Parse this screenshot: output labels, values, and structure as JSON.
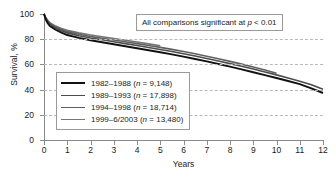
{
  "chart_data": {
    "type": "line",
    "title": "",
    "xlabel": "Years",
    "ylabel": "Survival, %",
    "xlim": [
      0,
      12
    ],
    "ylim": [
      0,
      100
    ],
    "xticks": [
      "0",
      "1",
      "2",
      "3",
      "4",
      "5",
      "6",
      "7",
      "8",
      "9",
      "10",
      "11",
      "12"
    ],
    "yticks": [
      "0",
      "20",
      "40",
      "60",
      "80",
      "100"
    ],
    "gridlines": {
      "y": [
        20,
        40,
        60,
        80
      ],
      "style": "dashed",
      "x": false
    },
    "legend_position": "inside-lower-left",
    "annotation": "All comparisons significant at p < 0.01",
    "annotation_prefix": "All comparisons significant at ",
    "annotation_italic": "p",
    "annotation_suffix": " < 0.01",
    "series": [
      {
        "name": "1982–1988",
        "n": "9,148",
        "label_prefix": "1982–1988 (",
        "label_italic": "n",
        "label_suffix": " = 9,148)",
        "color": "#111111",
        "x": [
          0,
          0.08,
          0.17,
          0.25,
          0.5,
          0.75,
          1,
          1.5,
          2,
          2.5,
          3,
          3.5,
          4,
          4.5,
          5,
          5.5,
          6,
          6.5,
          7,
          7.5,
          8,
          8.5,
          9,
          9.5,
          10,
          10.5,
          11,
          11.5,
          12
        ],
        "y": [
          100,
          95.5,
          92.5,
          90.5,
          87.5,
          85.2,
          83.3,
          81.0,
          79.2,
          77.6,
          76.0,
          74.4,
          72.8,
          71.2,
          69.6,
          68.0,
          66.2,
          64.3,
          62.4,
          60.3,
          58.2,
          56.0,
          53.8,
          51.5,
          49.2,
          46.8,
          44.3,
          41.0,
          37.3
        ]
      },
      {
        "name": "1989–1993",
        "n": "17,898",
        "label_prefix": "1989–1993 (",
        "label_italic": "n",
        "label_suffix": " = 17,898)",
        "color": "#4d4d4d",
        "x": [
          0,
          0.08,
          0.17,
          0.25,
          0.5,
          0.75,
          1,
          1.5,
          2,
          2.5,
          3,
          3.5,
          4,
          4.5,
          5,
          5.5,
          6,
          6.5,
          7,
          7.5,
          8,
          8.5,
          9,
          9.5,
          10,
          10.5,
          11,
          11.5,
          12
        ],
        "y": [
          100,
          96.2,
          93.6,
          91.8,
          88.8,
          86.7,
          85.0,
          82.8,
          81.0,
          79.5,
          78.0,
          76.5,
          75.0,
          73.4,
          71.8,
          70.2,
          68.4,
          66.6,
          64.7,
          62.7,
          60.6,
          58.5,
          56.3,
          54.0,
          51.7,
          49.2,
          46.7,
          43.8,
          40.2
        ]
      },
      {
        "name": "1994–1998",
        "n": "18,714",
        "label_prefix": "1994–1998 (",
        "label_italic": "n",
        "label_suffix": " = 18,714)",
        "color": "#606060",
        "x": [
          0,
          0.08,
          0.17,
          0.25,
          0.5,
          0.75,
          1,
          1.5,
          2,
          2.5,
          3,
          3.5,
          4,
          4.5,
          5,
          5.5,
          6,
          6.5,
          7,
          7.5,
          8,
          8.5,
          9,
          9.5,
          10
        ],
        "y": [
          100,
          96.6,
          94.2,
          92.5,
          89.6,
          87.6,
          86.0,
          83.9,
          82.2,
          80.8,
          79.4,
          78.0,
          76.5,
          75.0,
          73.5,
          71.9,
          70.2,
          68.4,
          66.5,
          64.5,
          62.4,
          60.2,
          57.9,
          55.5,
          53.0
        ]
      },
      {
        "name": "1999–6/2003",
        "n": "13,480",
        "label_prefix": "1999–6/2003 (",
        "label_italic": "n",
        "label_suffix": " = 13,480)",
        "color": "#757575",
        "x": [
          0,
          0.08,
          0.17,
          0.25,
          0.5,
          0.75,
          1,
          1.5,
          2,
          2.5,
          3,
          3.5,
          4,
          4.5,
          5
        ],
        "y": [
          100,
          97.0,
          94.8,
          93.2,
          90.4,
          88.5,
          87.0,
          85.0,
          83.4,
          82.0,
          80.6,
          79.2,
          77.8,
          76.3,
          74.8
        ]
      }
    ]
  }
}
